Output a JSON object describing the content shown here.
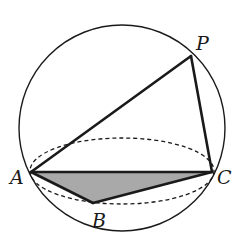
{
  "diagram": {
    "colors": {
      "stroke": "#1a1a1a",
      "base_fill": "#a9a9a9",
      "background": "#ffffff"
    },
    "sphere": {
      "cx": 122,
      "cy": 128,
      "r": 103
    },
    "section_ellipse": {
      "cx": 122,
      "cy": 171,
      "rx": 92,
      "ry": 33,
      "style": "dashed"
    },
    "points": {
      "P": {
        "label": "P",
        "x": 191,
        "y": 56,
        "label_x": 196,
        "label_y": 50
      },
      "A": {
        "label": "A",
        "x": 31,
        "y": 172,
        "label_x": 10,
        "label_y": 184
      },
      "B": {
        "label": "B",
        "x": 93,
        "y": 203,
        "label_x": 92,
        "label_y": 227
      },
      "C": {
        "label": "C",
        "x": 212,
        "y": 172,
        "label_x": 217,
        "label_y": 184
      }
    },
    "edges": [
      {
        "from": "P",
        "to": "A"
      },
      {
        "from": "P",
        "to": "C"
      },
      {
        "from": "A",
        "to": "C"
      },
      {
        "from": "A",
        "to": "B"
      },
      {
        "from": "B",
        "to": "C"
      }
    ],
    "shaded_face": [
      "A",
      "B",
      "C"
    ]
  }
}
